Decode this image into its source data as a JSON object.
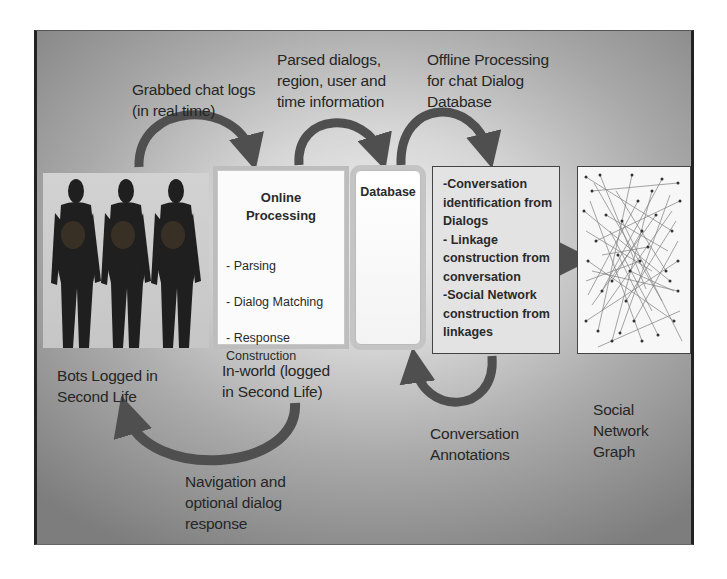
{
  "diagram": {
    "title": "",
    "labels": {
      "grabbed_chat_logs": "Grabbed chat logs\n(in real time)",
      "parsed_dialogs": "Parsed dialogs,\nregion, user and\ntime information",
      "offline_processing": "Offline Processing\nfor chat Dialog\nDatabase",
      "bots_logged_in": "Bots Logged in\nSecond Life",
      "in_world": "In-world (logged\nin Second Life)",
      "navigation": "Navigation and\noptional dialog\nresponse",
      "conversation_annotations": "Conversation\nAnnotations",
      "social_network_graph": "Social\nNetwork\nGraph"
    },
    "nodes": {
      "bots_image": {
        "description": "Three avatar bot figures",
        "count": 3
      },
      "online_processing": {
        "title": "Online\nProcessing",
        "items": [
          "- Parsing",
          "- Dialog Matching",
          "- Response\nConstruction"
        ]
      },
      "database": {
        "title": "Database"
      },
      "offline_box": {
        "items": [
          "-Conversation identification from Dialogs",
          "- Linkage construction from conversation",
          "-Social Network construction from linkages"
        ]
      },
      "social_graph_image": {
        "description": "Dense social network graph visualization"
      }
    },
    "colors": {
      "arrow": "#4f4f4f",
      "frame_border": "#222222",
      "background_center": "#f0f0f0",
      "background_edge": "#7d7d7d"
    }
  }
}
